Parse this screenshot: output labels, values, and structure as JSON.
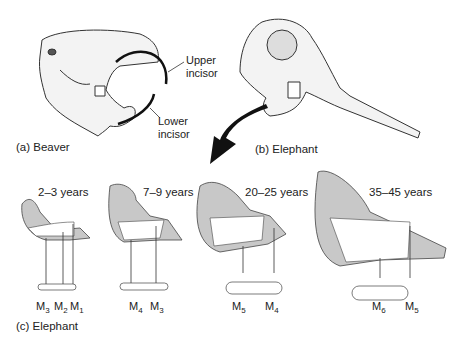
{
  "panels": {
    "a": {
      "caption": "(a) Beaver",
      "labels": {
        "upper": [
          "Upper",
          "incisor"
        ],
        "lower": [
          "Lower",
          "incisor"
        ]
      }
    },
    "b": {
      "caption": "(b) Elephant"
    },
    "c": {
      "caption": "(c) Elephant",
      "jaws": [
        {
          "age": "2–3 years",
          "molars": [
            {
              "m": "M",
              "sub": "3"
            },
            {
              "m": "M",
              "sub": "2"
            },
            {
              "m": "M",
              "sub": "1"
            }
          ]
        },
        {
          "age": "7–9 years",
          "molars": [
            {
              "m": "M",
              "sub": "4"
            },
            {
              "m": "M",
              "sub": "3"
            }
          ]
        },
        {
          "age": "20–25 years",
          "molars": [
            {
              "m": "M",
              "sub": "5"
            },
            {
              "m": "M",
              "sub": "4"
            }
          ]
        },
        {
          "age": "35–45 years",
          "molars": [
            {
              "m": "M",
              "sub": "6"
            },
            {
              "m": "M",
              "sub": "5"
            }
          ]
        }
      ]
    }
  },
  "colors": {
    "jaw_fill": "#c8c8c8",
    "line": "#222222",
    "arrow": "#111111"
  }
}
